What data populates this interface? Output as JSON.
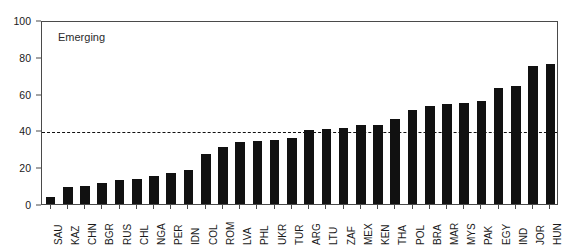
{
  "chart_data": {
    "type": "bar",
    "title": "",
    "panel_label": "Emerging",
    "xlabel": "",
    "ylabel": "",
    "ylim": [
      0,
      100
    ],
    "yticks": [
      0,
      20,
      40,
      60,
      80,
      100
    ],
    "ytick_labels": [
      "0",
      "20",
      "40",
      "60",
      "80",
      "100"
    ],
    "grid": false,
    "legend": "none",
    "bar_color": "#111111",
    "reference_line": {
      "value": 40,
      "style": "dashed",
      "color": "#111111"
    },
    "categories": [
      "SAU",
      "KAZ",
      "CHN",
      "BGR",
      "RUS",
      "CHL",
      "NGA",
      "PER",
      "IDN",
      "COL",
      "ROM",
      "LVA",
      "PHL",
      "UKR",
      "TUR",
      "ARG",
      "LTU",
      "ZAF",
      "MEX",
      "KEN",
      "THA",
      "POL",
      "BRA",
      "MAR",
      "MYS",
      "PAK",
      "EGY",
      "IND",
      "JOR",
      "HUN"
    ],
    "values": [
      4,
      9,
      10,
      11.5,
      13,
      13.5,
      15,
      17,
      18.5,
      27,
      31,
      33.5,
      34,
      35,
      36,
      40,
      40.5,
      41.5,
      43,
      43,
      46,
      51,
      53.5,
      54.5,
      55,
      56,
      63,
      64,
      75,
      76
    ]
  }
}
